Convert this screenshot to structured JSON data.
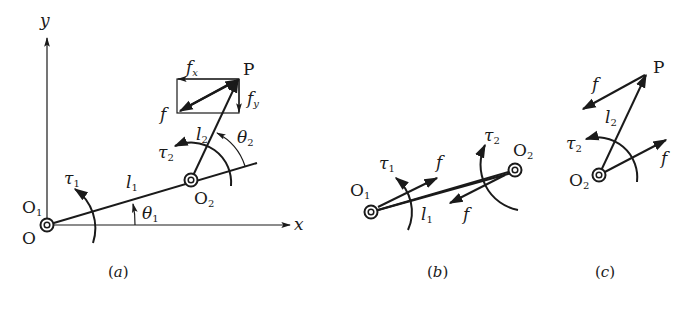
{
  "figure": {
    "panel_a": {
      "caption": "(a)",
      "caption_letter": "a",
      "axis_x_label": "x",
      "axis_y_label": "y",
      "origin_label": "O",
      "joint1_label": "O",
      "joint1_sub": "1",
      "joint2_label": "O",
      "joint2_sub": "2",
      "end_label": "P",
      "link1_label": "l",
      "link1_sub": "1",
      "link2_label": "l",
      "link2_sub": "2",
      "angle1_label": "θ",
      "angle1_sub": "1",
      "angle2_label": "θ",
      "angle2_sub": "2",
      "torque1_label": "τ",
      "torque1_sub": "1",
      "torque2_label": "τ",
      "torque2_sub": "2",
      "force_label": "f",
      "fx_label": "f",
      "fx_sub": "x",
      "fy_label": "f",
      "fy_sub": "y"
    },
    "panel_b": {
      "caption": "(b)",
      "caption_letter": "b",
      "joint1_label": "O",
      "joint1_sub": "1",
      "joint2_label": "O",
      "joint2_sub": "2",
      "link1_label": "l",
      "link1_sub": "1",
      "torque1_label": "τ",
      "torque1_sub": "1",
      "torque2_label": "τ",
      "torque2_sub": "2",
      "force_out_label": "f",
      "force_in_label": "f"
    },
    "panel_c": {
      "caption": "(c)",
      "caption_letter": "c",
      "joint2_label": "O",
      "joint2_sub": "2",
      "end_label": "P",
      "link2_label": "l",
      "link2_sub": "2",
      "torque2_label": "τ",
      "torque2_sub": "2",
      "force_end_label": "f",
      "force_base_label": "f"
    },
    "colors": {
      "ink": "#1a1a1a",
      "background": "#ffffff"
    }
  }
}
